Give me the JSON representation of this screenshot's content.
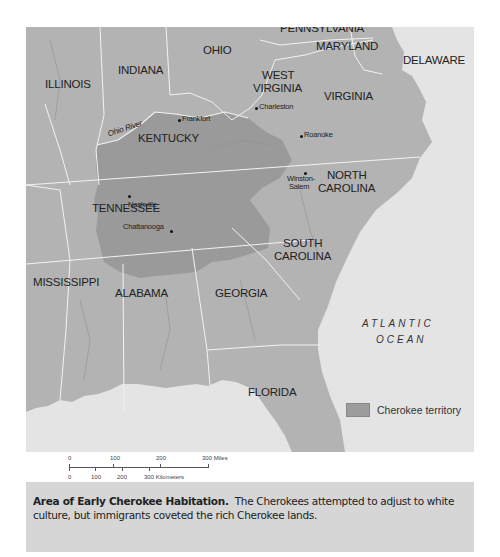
{
  "map": {
    "states": [
      {
        "name": "ILLINOIS",
        "x": 45,
        "y": 84
      },
      {
        "name": "INDIANA",
        "x": 118,
        "y": 70
      },
      {
        "name": "OHIO",
        "x": 203,
        "y": 50
      },
      {
        "name": "PENNSYLVANIA",
        "x": 280,
        "y": 28
      },
      {
        "name": "MARYLAND",
        "x": 316,
        "y": 46
      },
      {
        "name": "DELAWARE",
        "x": 403,
        "y": 60
      },
      {
        "name": "WEST",
        "x": 262,
        "y": 75
      },
      {
        "name": "VIRGINIA",
        "x": 253,
        "y": 88
      },
      {
        "name": "VIRGINIA",
        "x": 324,
        "y": 96
      },
      {
        "name": "KENTUCKY",
        "x": 138,
        "y": 138
      },
      {
        "name": "NORTH",
        "x": 327,
        "y": 175
      },
      {
        "name": "CAROLINA",
        "x": 318,
        "y": 188
      },
      {
        "name": "TENNESSEE",
        "x": 92,
        "y": 208
      },
      {
        "name": "SOUTH",
        "x": 283,
        "y": 243
      },
      {
        "name": "CAROLINA",
        "x": 274,
        "y": 256
      },
      {
        "name": "MISSISSIPPI",
        "x": 33,
        "y": 282
      },
      {
        "name": "ALABAMA",
        "x": 115,
        "y": 293
      },
      {
        "name": "GEORGIA",
        "x": 215,
        "y": 293
      },
      {
        "name": "FLORIDA",
        "x": 248,
        "y": 392
      }
    ],
    "cities": [
      {
        "name": "Frankfort",
        "x": 179,
        "y": 120,
        "dx": 3,
        "dy": -6
      },
      {
        "name": "Charleston",
        "x": 256,
        "y": 108,
        "dx": 3,
        "dy": -6
      },
      {
        "name": "Roanoke",
        "x": 301,
        "y": 136,
        "dx": 3,
        "dy": -6
      },
      {
        "name": "Winston-",
        "x": 305,
        "y": 173,
        "dx": -18,
        "dy": 1
      },
      {
        "name": "Salem",
        "x": 305,
        "y": 173,
        "dx": -16,
        "dy": 9
      },
      {
        "name": "Nashville",
        "x": 129,
        "y": 196,
        "dx": -1,
        "dy": 4
      },
      {
        "name": "Chattanooga",
        "x": 171,
        "y": 231,
        "dx": -48,
        "dy": -9
      }
    ],
    "river": {
      "name": "Ohio River",
      "x": 107,
      "y": 128
    },
    "ocean": {
      "line1": "ATLANTIC",
      "line2": "OCEAN"
    },
    "legend": {
      "label": "Cherokee territory",
      "color": "#9c9c9c"
    },
    "scale": {
      "miles": [
        "0",
        "100",
        "200",
        "300 Miles"
      ],
      "kilometers": [
        "0",
        "100",
        "200",
        "300 Kilometers"
      ]
    },
    "colors": {
      "land": "#b3b3b3",
      "cherokee": "#9a9a9a",
      "water": "#e4e4e4",
      "border": "#f2f2f2"
    }
  },
  "caption": {
    "title": "Area of Early Cherokee Habitation.",
    "text": "The Cherokees attempted to adjust to white culture, but immigrants coveted the rich Cherokee lands."
  }
}
